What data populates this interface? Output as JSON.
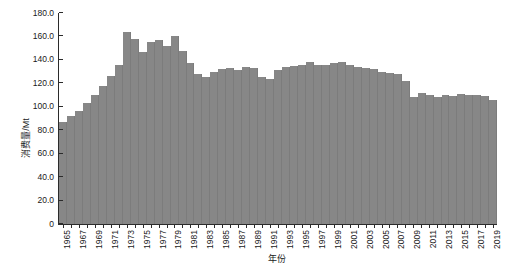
{
  "chart_data": {
    "type": "bar",
    "title": "",
    "subtitle": "",
    "xlabel": "年份",
    "ylabel": "消费量/Mt",
    "ylim": [
      0,
      180
    ],
    "yticks": [
      "0",
      "20.0",
      "40.0",
      "60.0",
      "80.0",
      "100.0",
      "120.0",
      "140.0",
      "160.0",
      "180.0"
    ],
    "ytick_values": [
      0,
      20,
      40,
      60,
      80,
      100,
      120,
      140,
      160,
      180
    ],
    "grid": false,
    "legend": null,
    "xlim": [
      1965,
      2019
    ],
    "categories": [
      "1965",
      "1966",
      "1967",
      "1968",
      "1969",
      "1970",
      "1971",
      "1972",
      "1973",
      "1974",
      "1975",
      "1976",
      "1977",
      "1978",
      "1979",
      "1980",
      "1981",
      "1982",
      "1983",
      "1984",
      "1985",
      "1986",
      "1987",
      "1988",
      "1989",
      "1990",
      "1991",
      "1992",
      "1993",
      "1994",
      "1995",
      "1996",
      "1997",
      "1998",
      "1999",
      "2000",
      "2001",
      "2002",
      "2003",
      "2004",
      "2005",
      "2006",
      "2007",
      "2008",
      "2009",
      "2010",
      "2011",
      "2012",
      "2013",
      "2014",
      "2015",
      "2016",
      "2017",
      "2018",
      "2019"
    ],
    "xtick_labels": [
      "1965",
      "1967",
      "1969",
      "1971",
      "1973",
      "1975",
      "1977",
      "1979",
      "1981",
      "1983",
      "1985",
      "1987",
      "1989",
      "1991",
      "1993",
      "1995",
      "1997",
      "1999",
      "2001",
      "2003",
      "2005",
      "2007",
      "2009",
      "2011",
      "2013",
      "2015",
      "2017",
      "2019"
    ],
    "values": [
      87.0,
      92.0,
      96.0,
      103.0,
      110.0,
      118.0,
      126.0,
      136.0,
      164.0,
      158.0,
      147.0,
      155.0,
      157.0,
      152.0,
      160.0,
      148.0,
      137.0,
      128.0,
      125.0,
      130.0,
      132.0,
      133.0,
      131.0,
      134.0,
      133.0,
      125.0,
      124.0,
      131.0,
      134.0,
      135.0,
      136.0,
      138.0,
      136.0,
      136.0,
      137.0,
      138.0,
      136.0,
      134.0,
      133.0,
      132.0,
      130.0,
      129.0,
      128.0,
      122.0,
      108.0,
      112.0,
      110.0,
      108.0,
      110.0,
      109.0,
      111.0,
      110.0,
      110.0,
      109.0,
      106.0
    ],
    "series_color": "#878787"
  }
}
